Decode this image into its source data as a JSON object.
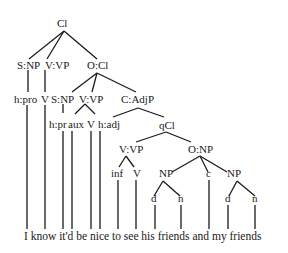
{
  "diagram": {
    "type": "syntax-tree",
    "sentence": "I know it'd be nice to see his friends and my friends",
    "nodes": {
      "root": "Cl",
      "subj": "S:NP",
      "verb": "V:VP",
      "obj": "O:Cl",
      "h_pro": "h:pro",
      "v_know": "V",
      "obj_subj": "S:NP",
      "obj_verb": "V:VP",
      "comp": "C:AdjP",
      "h_pr": "h:pr",
      "aux": "aux",
      "v_be": "V",
      "h_adj": "h:adj",
      "qcl": "qCl",
      "q_verb": "V:VP",
      "q_obj": "O:NP",
      "inf": "inf",
      "v_see": "V",
      "np1": "NP",
      "conj": "c",
      "np2": "NP",
      "d1": "d",
      "n1": "n",
      "d2": "d",
      "n2": "n"
    }
  }
}
